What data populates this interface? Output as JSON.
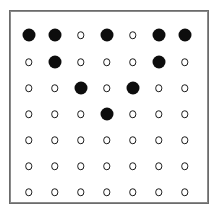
{
  "figure": {
    "name": "dot-matrix-grid",
    "background_color": "#ffffff",
    "frame": {
      "border_color": "#6b6b6b",
      "border_width_px": 1.4,
      "x_px": 9,
      "y_px": 10,
      "width_px": 200,
      "height_px": 194
    },
    "markers": {
      "filled": {
        "label": "large filled dot",
        "color": "#0d0d0d",
        "diameter_px": 13
      },
      "open": {
        "label": "small open circle",
        "fill_color": "#ffffff",
        "stroke_color": "#1a1a1a",
        "diameter_px": 7.5
      }
    }
  },
  "chart_data": {
    "type": "heatmap",
    "title": "",
    "subtitle": "",
    "xlabel": "",
    "ylabel": "",
    "grid": false,
    "legend_position": "none",
    "rows": 7,
    "columns": 7,
    "x": [
      1,
      2,
      3,
      4,
      5,
      6,
      7
    ],
    "y": [
      1,
      2,
      3,
      4,
      5,
      6,
      7
    ],
    "xticklabels": [
      "",
      "",
      "",
      "",
      "",
      "",
      ""
    ],
    "yticklabels": [
      "",
      "",
      "",
      "",
      "",
      "",
      ""
    ],
    "value_encoding": {
      "1": "large filled dot",
      "0": "small open circle"
    },
    "values": [
      [
        1,
        1,
        0,
        1,
        0,
        1,
        1
      ],
      [
        0,
        1,
        0,
        0,
        0,
        1,
        0
      ],
      [
        0,
        0,
        1,
        0,
        1,
        0,
        0
      ],
      [
        0,
        0,
        0,
        1,
        0,
        0,
        0
      ],
      [
        0,
        0,
        0,
        0,
        0,
        0,
        0
      ],
      [
        0,
        0,
        0,
        0,
        0,
        0,
        0
      ],
      [
        0,
        0,
        0,
        0,
        0,
        0,
        0
      ]
    ],
    "filled_count": 11,
    "open_count": 38,
    "annotations": []
  },
  "layout": {
    "column_centers_px": [
      27.5,
      53.5,
      79.5,
      105.5,
      131.5,
      157.5,
      183.5
    ],
    "row_centers_px": [
      34,
      61,
      87,
      113,
      139,
      165,
      191
    ]
  }
}
